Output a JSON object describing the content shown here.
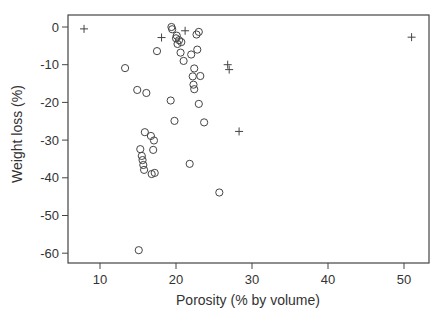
{
  "chart_data": {
    "type": "scatter",
    "title": "",
    "xlabel": "Porosity (% by volume)",
    "ylabel": "Weight loss (%)",
    "xlim": [
      5.5,
      52.5
    ],
    "ylim": [
      -62.5,
      3
    ],
    "xticks": [
      10,
      20,
      30,
      40,
      50
    ],
    "yticks": [
      0,
      -10,
      -20,
      -30,
      -40,
      -50,
      -60
    ],
    "xtick_labels": [
      "10",
      "20",
      "30",
      "40",
      "50"
    ],
    "ytick_labels": [
      "0",
      "-10",
      "-20",
      "-30",
      "-40",
      "-50",
      "-60"
    ],
    "grid": false,
    "legend": null,
    "series": [
      {
        "name": "circles",
        "marker": "circle",
        "points": [
          [
            19.4,
            0.0
          ],
          [
            19.5,
            -0.6
          ],
          [
            20.0,
            -3.0
          ],
          [
            20.2,
            -4.5
          ],
          [
            20.4,
            -3.5
          ],
          [
            20.7,
            -4.0
          ],
          [
            20.1,
            -2.3
          ],
          [
            23.0,
            -1.3
          ],
          [
            22.7,
            -2.0
          ],
          [
            17.5,
            -6.4
          ],
          [
            20.6,
            -6.8
          ],
          [
            21.0,
            -9.0
          ],
          [
            22.0,
            -7.3
          ],
          [
            22.8,
            -6.0
          ],
          [
            23.2,
            -13.0
          ],
          [
            22.4,
            -11.0
          ],
          [
            22.2,
            -13.1
          ],
          [
            22.3,
            -15.3
          ],
          [
            22.4,
            -16.5
          ],
          [
            13.3,
            -10.9
          ],
          [
            14.9,
            -16.7
          ],
          [
            16.1,
            -17.5
          ],
          [
            19.3,
            -19.5
          ],
          [
            23.0,
            -20.4
          ],
          [
            19.8,
            -24.9
          ],
          [
            23.7,
            -25.3
          ],
          [
            15.9,
            -27.9
          ],
          [
            16.7,
            -28.9
          ],
          [
            17.1,
            -30.1
          ],
          [
            15.3,
            -32.4
          ],
          [
            17.0,
            -32.6
          ],
          [
            15.5,
            -34.2
          ],
          [
            15.6,
            -35.3
          ],
          [
            15.7,
            -36.6
          ],
          [
            15.8,
            -37.9
          ],
          [
            16.8,
            -39.0
          ],
          [
            17.2,
            -38.7
          ],
          [
            21.8,
            -36.3
          ],
          [
            25.7,
            -43.9
          ],
          [
            15.1,
            -59.2
          ]
        ]
      },
      {
        "name": "plus",
        "marker": "plus",
        "points": [
          [
            7.9,
            -0.5
          ],
          [
            18.1,
            -2.8
          ],
          [
            21.2,
            -1.0
          ],
          [
            26.8,
            -10.0
          ],
          [
            27.0,
            -11.3
          ],
          [
            28.3,
            -27.7
          ],
          [
            51.0,
            -2.7
          ]
        ]
      }
    ]
  }
}
